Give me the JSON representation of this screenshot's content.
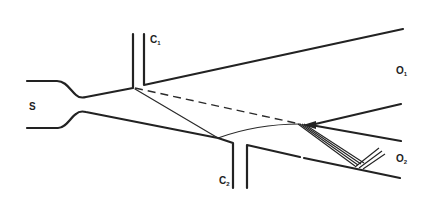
{
  "diagram": {
    "type": "fluidic-channel-schematic",
    "line_color": "#222222",
    "labels": {
      "source": "S",
      "control_1": "C",
      "control_1_sub": "1",
      "control_2": "C",
      "control_2_sub": "2",
      "output_1": "O",
      "output_1_sub": "1",
      "output_2": "O",
      "output_2_sub": "2"
    },
    "elements": [
      "supply-nozzle",
      "control-port-1",
      "control-port-2",
      "output-channel-1",
      "output-channel-2",
      "flow-splitter",
      "undeflected-jet-path-dashed",
      "deflected-jet-path"
    ]
  }
}
